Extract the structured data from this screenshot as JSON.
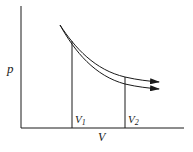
{
  "diagram": {
    "type": "pV-diagram",
    "axes": {
      "y_label": "p",
      "x_label": "V"
    },
    "markers": [
      {
        "symbol": "V",
        "subscript": "1"
      },
      {
        "symbol": "V",
        "subscript": "2"
      }
    ],
    "curves": [
      {
        "name": "upper-curve",
        "description": "expansion curve (upper)",
        "arrow": "right"
      },
      {
        "name": "lower-curve",
        "description": "expansion curve (lower)",
        "arrow": "right"
      }
    ],
    "colors": {
      "line": "#1a1a1a",
      "background": "#ffffff"
    }
  }
}
